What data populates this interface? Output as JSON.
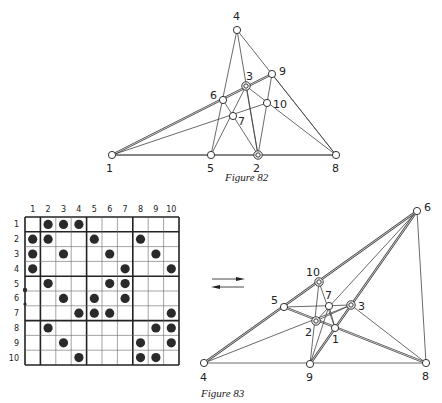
{
  "figure82": {
    "caption": "Figure 82",
    "nodes": [
      {
        "id": "1",
        "x": 112,
        "y": 155,
        "lx": 106,
        "ly": 172
      },
      {
        "id": "2",
        "x": 258,
        "y": 155,
        "lx": 253,
        "ly": 172,
        "double": true
      },
      {
        "id": "3",
        "x": 246,
        "y": 86,
        "lx": 246,
        "ly": 80,
        "double": true
      },
      {
        "id": "4",
        "x": 237,
        "y": 30,
        "lx": 233,
        "ly": 20
      },
      {
        "id": "5",
        "x": 211,
        "y": 155,
        "lx": 207,
        "ly": 172
      },
      {
        "id": "6",
        "x": 223,
        "y": 100,
        "lx": 210,
        "ly": 99
      },
      {
        "id": "7",
        "x": 233,
        "y": 116,
        "lx": 238,
        "ly": 125
      },
      {
        "id": "8",
        "x": 336,
        "y": 155,
        "lx": 332,
        "ly": 172
      },
      {
        "id": "9",
        "x": 272,
        "y": 74,
        "lx": 279,
        "ly": 75
      },
      {
        "id": "10",
        "x": 267,
        "y": 103,
        "lx": 273,
        "ly": 108
      }
    ],
    "edges_single": [
      [
        "1",
        "10"
      ],
      [
        "4",
        "5"
      ],
      [
        "4",
        "2"
      ],
      [
        "4",
        "8"
      ],
      [
        "3",
        "5"
      ],
      [
        "3",
        "2"
      ],
      [
        "3",
        "8"
      ],
      [
        "6",
        "2"
      ],
      [
        "9",
        "2"
      ],
      [
        "9",
        "8"
      ]
    ],
    "edges_double": [
      [
        "1",
        "9"
      ],
      [
        "1",
        "8"
      ]
    ]
  },
  "figure83": {
    "caption": "Figure 83",
    "grid": {
      "col_labels": [
        "1",
        "2",
        "3",
        "4",
        "5",
        "6",
        "7",
        "8",
        "9",
        "10"
      ],
      "row_labels": [
        "1",
        "2",
        "3",
        "4",
        "5",
        "6",
        "7",
        "8",
        "9",
        "10"
      ],
      "filled": [
        [
          2,
          3,
          4
        ],
        [
          1,
          2,
          5,
          8
        ],
        [
          1,
          3,
          6,
          9
        ],
        [
          1,
          7,
          10
        ],
        [
          2,
          6,
          7
        ],
        [
          3,
          5,
          7
        ],
        [
          4,
          5,
          6,
          10
        ],
        [
          2,
          9,
          10
        ],
        [
          3,
          8,
          10
        ],
        [
          4,
          8,
          9
        ]
      ],
      "thick_after": [
        1,
        4,
        7
      ]
    },
    "arrows": {
      "forward": "→",
      "backward": "←"
    },
    "nodes": [
      {
        "id": "1",
        "x": 335,
        "y": 328,
        "lx": 332,
        "ly": 343
      },
      {
        "id": "2",
        "x": 316,
        "y": 321,
        "lx": 305,
        "ly": 336,
        "double": true
      },
      {
        "id": "3",
        "x": 351,
        "y": 305,
        "lx": 358,
        "ly": 310,
        "double": true
      },
      {
        "id": "4",
        "x": 204,
        "y": 363,
        "lx": 200,
        "ly": 381
      },
      {
        "id": "5",
        "x": 284,
        "y": 307,
        "lx": 271,
        "ly": 304
      },
      {
        "id": "6",
        "x": 417,
        "y": 211,
        "lx": 424,
        "ly": 211
      },
      {
        "id": "7",
        "x": 329,
        "y": 306,
        "lx": 325,
        "ly": 299
      },
      {
        "id": "8",
        "x": 426,
        "y": 363,
        "lx": 422,
        "ly": 380
      },
      {
        "id": "9",
        "x": 310,
        "y": 364,
        "lx": 306,
        "ly": 381
      },
      {
        "id": "10",
        "x": 319,
        "y": 282,
        "lx": 306,
        "ly": 276,
        "double": true
      }
    ],
    "edges_single": [
      [
        "4",
        "3"
      ],
      [
        "4",
        "8"
      ],
      [
        "6",
        "2"
      ],
      [
        "6",
        "8"
      ],
      [
        "10",
        "1"
      ],
      [
        "10",
        "9"
      ],
      [
        "5",
        "3"
      ],
      [
        "7",
        "9"
      ],
      [
        "3",
        "8"
      ],
      [
        "2",
        "3"
      ],
      [
        "7",
        "1"
      ]
    ],
    "edges_double": [
      [
        "4",
        "6"
      ],
      [
        "6",
        "9"
      ],
      [
        "5",
        "8"
      ]
    ]
  }
}
